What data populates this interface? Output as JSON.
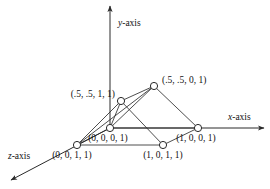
{
  "figure": {
    "background_color": "#ffffff",
    "line_color": "#2a2a2a",
    "node_fill_color": "#ffffff"
  },
  "axes": [
    {
      "id": "y-axis",
      "label": "y-axis",
      "italic_part": "y",
      "rest_part": "-axis",
      "label_x": 118,
      "label_y": 26,
      "from_x": 110,
      "from_y": 128,
      "to_x": 110,
      "to_y": 6
    },
    {
      "id": "x-axis",
      "label": "x-axis",
      "italic_part": "x",
      "rest_part": "-axis",
      "label_x": 228,
      "label_y": 120,
      "from_x": 110,
      "from_y": 128,
      "to_x": 264,
      "to_y": 128
    },
    {
      "id": "z-axis",
      "label": "z-axis",
      "italic_part": "z",
      "rest_part": "-axis",
      "label_x": 8,
      "label_y": 159,
      "from_x": 110,
      "from_y": 128,
      "to_x": 11,
      "to_y": 180
    }
  ],
  "nodes": [
    {
      "id": "origin",
      "label": "(0, 0, 0, 1)",
      "x": 110,
      "y": 128,
      "r": 3.6,
      "label_x": 108,
      "label_y": 141,
      "label_anchor": "middle"
    },
    {
      "id": "x-unit",
      "label": "(1, 0, 0, 1)",
      "x": 198,
      "y": 128,
      "r": 3.6,
      "label_x": 196,
      "label_y": 141,
      "label_anchor": "middle"
    },
    {
      "id": "z-unit",
      "label": "(0, 0, 1, 1)",
      "x": 77,
      "y": 145,
      "r": 3.6,
      "label_x": 72,
      "label_y": 158,
      "label_anchor": "middle"
    },
    {
      "id": "xz-unit",
      "label": "(1, 0, 1, 1)",
      "x": 163,
      "y": 145,
      "r": 3.6,
      "label_x": 163,
      "label_y": 158,
      "label_anchor": "middle"
    },
    {
      "id": "apex-front",
      "label": "(.5, .5, 1, 1)",
      "x": 121,
      "y": 101,
      "r": 3.6,
      "label_x": 115,
      "label_y": 97,
      "label_anchor": "end"
    },
    {
      "id": "apex-back",
      "label": "(.5, .5, 0, 1)",
      "x": 154,
      "y": 86,
      "r": 3.6,
      "label_x": 162,
      "label_y": 83,
      "label_anchor": "start"
    }
  ],
  "edges": [
    {
      "id": "edge-origin-zunit",
      "from": "origin",
      "to": "z-unit"
    },
    {
      "id": "edge-zunit-xzunit",
      "from": "z-unit",
      "to": "xz-unit"
    },
    {
      "id": "edge-xzunit-xunit",
      "from": "xz-unit",
      "to": "x-unit"
    },
    {
      "id": "edge-origin-xunit",
      "from": "origin",
      "to": "x-unit"
    },
    {
      "id": "edge-zunit-apexfront",
      "from": "z-unit",
      "to": "apex-front"
    },
    {
      "id": "edge-origin-apexfront",
      "from": "origin",
      "to": "apex-front"
    },
    {
      "id": "edge-apexfront-apexback",
      "from": "apex-front",
      "to": "apex-back"
    },
    {
      "id": "edge-apexfront-xzunit",
      "from": "apex-front",
      "to": "xz-unit"
    },
    {
      "id": "edge-zunit-apexback",
      "from": "z-unit",
      "to": "apex-back"
    },
    {
      "id": "edge-origin-apexback",
      "from": "origin",
      "to": "apex-back"
    },
    {
      "id": "edge-apexback-xunit",
      "from": "apex-back",
      "to": "x-unit"
    }
  ]
}
